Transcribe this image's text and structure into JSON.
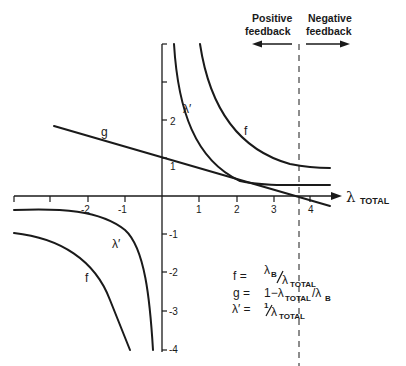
{
  "header": {
    "positive_line1": "Positive",
    "positive_line2": "feedback",
    "negative_line1": "Negative",
    "negative_line2": "feedback"
  },
  "axes": {
    "x_symbol": "λ",
    "x_subscript": "TOTAL",
    "x_ticks": [
      "-2",
      "-1",
      "1",
      "2",
      "3",
      "4"
    ],
    "y_ticks_pos": [
      "1",
      "2"
    ],
    "y_ticks_neg": [
      "-1",
      "-2",
      "-3",
      "-4"
    ]
  },
  "curves": {
    "f": "f",
    "g": "g",
    "lambda_prime": "λ′",
    "f_neg": "f",
    "lambda_prime_neg": "λ′"
  },
  "legend": {
    "f_lhs": "f  =",
    "f_num": "λ",
    "f_num_sub": "B",
    "f_den": "λ",
    "f_den_sub": "TOTAL",
    "g_lhs": "g  =",
    "g_rhs": "1−λ",
    "g_sub": "TOTAL",
    "g_tail": "/λ",
    "g_tail_sub": "B",
    "l_lhs": "λ′ =",
    "l_num": "1",
    "l_den": "λ",
    "l_den_sub": "TOTAL"
  },
  "colors": {
    "ink": "#1a1a1a",
    "background": "#ffffff"
  }
}
